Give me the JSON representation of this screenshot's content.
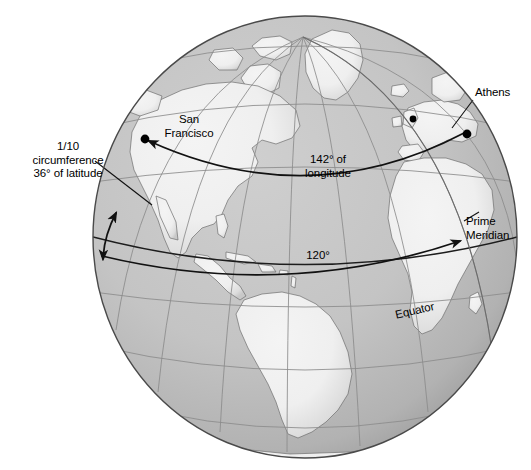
{
  "figure": {
    "type": "globe-diagram",
    "view": {
      "center_longitude_deg": -40,
      "center_latitude_deg": 10,
      "projection": "orthographic"
    },
    "colors": {
      "ocean": "#c2c2c2",
      "ocean_shade": "#a9a9a9",
      "land": "#f1f1f1",
      "land_shade": "#d8d8d8",
      "graticule": "#8d8d8d",
      "outline": "#4a4a4a",
      "annotation": "#000000",
      "background": "#ffffff"
    }
  },
  "annotations": {
    "circumference": {
      "label": "1/10\ncircumference\n36° of latitude",
      "lines": [
        "1/10",
        "circumference",
        "36° of latitude"
      ],
      "leader": true
    },
    "san_francisco": {
      "label": "San\nFrancisco",
      "lines": [
        "San",
        "Francisco"
      ],
      "marker": true
    },
    "athens": {
      "label": "Athens",
      "lines": [
        "Athens"
      ],
      "marker": true,
      "leader": true
    },
    "longitude": {
      "label": "142° of\nlongitude",
      "lines": [
        "142° of",
        "longitude"
      ],
      "value_deg": 142
    },
    "degrees_120": {
      "label": "120°",
      "lines": [
        "120°"
      ],
      "value_deg": 120
    },
    "prime_meridian": {
      "label": "Prime\nMeridian",
      "lines": [
        "Prime",
        "Meridian"
      ],
      "leader": true
    },
    "equator": {
      "label": "Equator",
      "lines": [
        "Equator"
      ],
      "latitude_deg": 0
    }
  },
  "graticule": {
    "meridian_spacing_deg": 20,
    "parallel_spacing_deg": 20
  }
}
